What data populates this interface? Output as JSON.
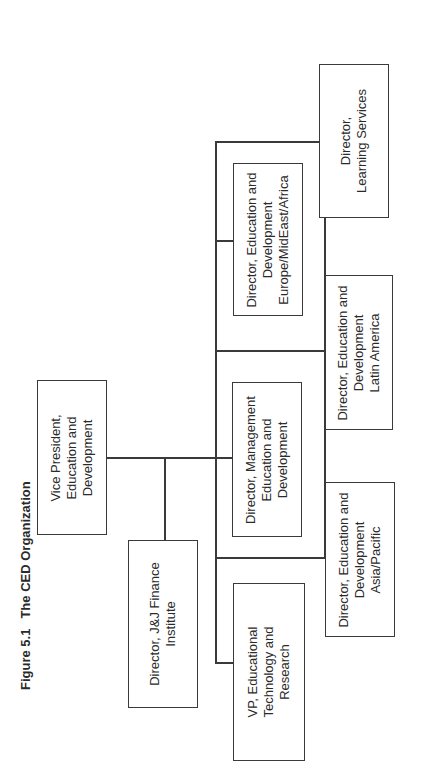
{
  "figure": {
    "number": "Figure 5.1",
    "title": "The CED Organization",
    "orientation": "rotated 90° counterclockwise"
  },
  "org_chart": {
    "root": {
      "id": "vp-education-development",
      "lines": [
        "Vice President,",
        "Education and",
        "Development"
      ]
    },
    "staff": {
      "id": "director-jj-finance",
      "lines": [
        "Director, J&J Finance",
        "Institute"
      ]
    },
    "reports": [
      {
        "id": "vp-ed-tech",
        "lines": [
          "VP, Educational",
          "Technology and",
          "Research"
        ]
      },
      {
        "id": "director-management-ed",
        "lines": [
          "Director, Management",
          "Education and",
          "Development"
        ]
      },
      {
        "id": "director-europe",
        "lines": [
          "Director, Education and",
          "Development",
          "Europe/MidEast/Africa"
        ]
      },
      {
        "id": "director-asia-pacific",
        "lines": [
          "Director, Education and",
          "Development",
          "Asia/Pacific"
        ]
      },
      {
        "id": "director-latin-america",
        "lines": [
          "Director, Education and",
          "Development",
          "Latin America"
        ]
      },
      {
        "id": "director-learning-services",
        "lines": [
          "Director,",
          "Learning Services"
        ]
      }
    ]
  },
  "colors": {
    "line": "#3a3a3a",
    "text": "#2a2a2a",
    "background": "#ffffff"
  }
}
